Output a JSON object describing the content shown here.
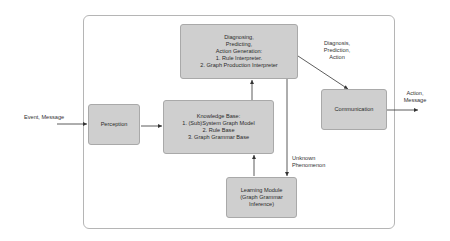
{
  "diagram": {
    "nodes": {
      "diagnosing": {
        "lines": [
          "Diagnosing,",
          "Predicting,",
          "Action Generation:",
          "1. Rule Interpreter.",
          "2. Graph Production Interpreter"
        ]
      },
      "knowledge": {
        "lines": [
          "Knowledge Base:",
          "1. (Sub)System Graph Model",
          "2. Rule Base",
          "3. Graph Grammar Base"
        ]
      },
      "perception": {
        "lines": [
          "Perception"
        ]
      },
      "communication": {
        "lines": [
          "Communication"
        ]
      },
      "learning": {
        "lines": [
          "Learning Module",
          "(Graph Grammar",
          "Inference)"
        ]
      }
    },
    "edge_labels": {
      "input": [
        "Event, Message"
      ],
      "diag_to_comm": [
        "Diagnosis,",
        "Prediction,",
        "Action"
      ],
      "output": [
        "Action,",
        "Message"
      ],
      "unknown": [
        "Unknown",
        "Phenomenon"
      ]
    },
    "colors": {
      "box_fill": "#cfcfcf",
      "box_border": "#a9a9a9",
      "arrow": "#333333",
      "outer_border": "#b5b5b5"
    }
  }
}
